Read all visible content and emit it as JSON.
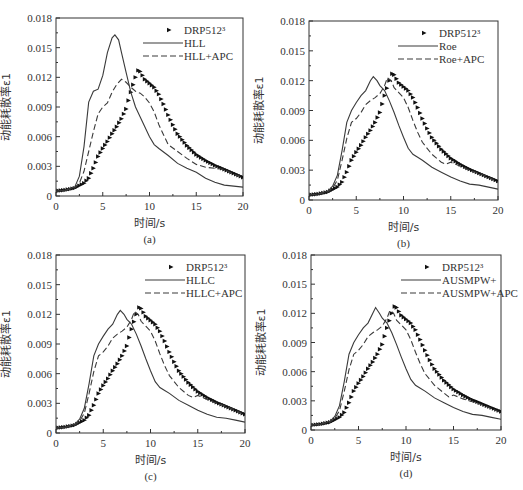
{
  "chart_data": [
    {
      "panel": "a",
      "type": "line",
      "caption": "(a)",
      "xlabel": "时间/s",
      "ylabel": "动能耗散率ε1",
      "xlim": [
        0,
        20
      ],
      "ylim": [
        0,
        0.018
      ],
      "xticks": [
        0,
        5,
        10,
        15,
        20
      ],
      "yticks": [
        0,
        0.003,
        0.006,
        0.009,
        0.012,
        0.015,
        0.018
      ],
      "ytick_labels": [
        "0",
        "0.003",
        "0.006",
        "0.009",
        "0.012",
        "0.015",
        "0.018"
      ],
      "legend_position": "upper right",
      "frame": {
        "x0": 56,
        "y0": 18,
        "x1": 243,
        "y1": 196
      },
      "series": [
        {
          "name": "DRP512³",
          "style": "markers",
          "x": [
            0,
            1,
            2,
            3,
            3.5,
            4,
            4.5,
            5,
            5.5,
            6,
            6.5,
            7,
            7.5,
            8,
            8.5,
            8.8,
            9,
            9.5,
            10,
            10.5,
            11,
            11.5,
            12,
            12.5,
            13,
            13.5,
            14,
            15,
            16,
            17,
            18,
            19,
            20
          ],
          "y": [
            0.0005,
            0.0006,
            0.0008,
            0.0013,
            0.0018,
            0.0028,
            0.004,
            0.0048,
            0.0055,
            0.0063,
            0.007,
            0.0078,
            0.0088,
            0.0105,
            0.012,
            0.0127,
            0.0126,
            0.0118,
            0.0114,
            0.011,
            0.0103,
            0.0093,
            0.0082,
            0.0072,
            0.0063,
            0.0057,
            0.0051,
            0.0042,
            0.0036,
            0.0031,
            0.0027,
            0.0023,
            0.0019
          ]
        },
        {
          "name": "HLL",
          "style": "solid",
          "x": [
            0,
            1,
            2,
            2.5,
            3,
            3.5,
            4,
            4.5,
            5,
            5.5,
            6,
            6.3,
            6.7,
            7,
            7.5,
            8,
            8.5,
            9,
            9.5,
            10,
            10.5,
            11,
            12,
            13,
            14,
            15,
            16,
            17,
            18,
            19,
            20
          ],
          "y": [
            0.0005,
            0.0006,
            0.0009,
            0.002,
            0.005,
            0.0095,
            0.0106,
            0.0108,
            0.0122,
            0.0145,
            0.016,
            0.0163,
            0.0158,
            0.0145,
            0.0125,
            0.0105,
            0.009,
            0.008,
            0.007,
            0.006,
            0.0052,
            0.0048,
            0.0041,
            0.0033,
            0.0028,
            0.0024,
            0.0018,
            0.0014,
            0.0011,
            0.001,
            0.0009
          ]
        },
        {
          "name": "HLL+APC",
          "style": "dashed",
          "x": [
            0,
            1,
            2,
            2.5,
            3,
            3.5,
            4,
            4.5,
            5,
            5.5,
            6,
            6.5,
            7,
            7.5,
            8,
            8.5,
            9,
            9.5,
            10,
            10.5,
            11,
            11.5,
            12,
            13,
            14,
            15,
            16,
            17,
            18,
            19,
            20
          ],
          "y": [
            0.0005,
            0.0006,
            0.0008,
            0.0013,
            0.0025,
            0.0045,
            0.0065,
            0.0083,
            0.009,
            0.0094,
            0.0105,
            0.0113,
            0.0118,
            0.0115,
            0.011,
            0.0106,
            0.0104,
            0.01,
            0.0094,
            0.0085,
            0.0072,
            0.0062,
            0.0052,
            0.0045,
            0.0038,
            0.0032,
            0.0029,
            0.0028,
            0.0027,
            0.0022,
            0.0019
          ]
        }
      ]
    },
    {
      "panel": "b",
      "type": "line",
      "caption": "(b)",
      "xlabel": "时间/s",
      "ylabel": "动能耗散率ε1",
      "xlim": [
        0,
        20
      ],
      "ylim": [
        0,
        0.018
      ],
      "xticks": [
        0,
        5,
        10,
        15,
        20
      ],
      "yticks": [
        0,
        0.003,
        0.006,
        0.009,
        0.012,
        0.015,
        0.018
      ],
      "ytick_labels": [
        "0",
        "0.003",
        "0.006",
        "0.009",
        "0.012",
        "0.015",
        "0.018"
      ],
      "legend_position": "upper right",
      "frame": {
        "x0": 309,
        "y0": 21,
        "x1": 498,
        "y1": 200
      },
      "series": [
        {
          "name": "DRP512³",
          "style": "markers",
          "x": [
            0,
            1,
            2,
            3,
            3.5,
            4,
            4.5,
            5,
            5.5,
            6,
            6.5,
            7,
            7.5,
            8,
            8.5,
            8.8,
            9,
            9.5,
            10,
            10.5,
            11,
            11.5,
            12,
            12.5,
            13,
            13.5,
            14,
            15,
            16,
            17,
            18,
            19,
            20
          ],
          "y": [
            0.0005,
            0.0006,
            0.0008,
            0.0013,
            0.0018,
            0.0028,
            0.004,
            0.0048,
            0.0055,
            0.0063,
            0.007,
            0.0078,
            0.0088,
            0.0105,
            0.012,
            0.0127,
            0.0126,
            0.0118,
            0.0114,
            0.011,
            0.0103,
            0.0093,
            0.0082,
            0.0072,
            0.0063,
            0.0057,
            0.0051,
            0.0042,
            0.0036,
            0.0031,
            0.0027,
            0.0023,
            0.0019
          ]
        },
        {
          "name": "Roe",
          "style": "solid",
          "x": [
            0,
            1,
            2,
            2.5,
            3,
            3.5,
            4,
            4.5,
            5,
            5.5,
            6,
            6.5,
            6.8,
            7.2,
            7.5,
            8,
            8.5,
            9,
            9.5,
            10,
            10.5,
            11,
            11.5,
            12,
            13,
            14,
            15,
            16,
            17,
            18,
            19,
            20
          ],
          "y": [
            0.0005,
            0.0006,
            0.0009,
            0.0014,
            0.0025,
            0.005,
            0.0078,
            0.009,
            0.0098,
            0.0105,
            0.011,
            0.012,
            0.0124,
            0.012,
            0.0115,
            0.011,
            0.01,
            0.0088,
            0.0075,
            0.0063,
            0.0052,
            0.0046,
            0.0043,
            0.004,
            0.0033,
            0.0028,
            0.0023,
            0.0019,
            0.0016,
            0.0015,
            0.0013,
            0.0011
          ]
        },
        {
          "name": "Roe+APC",
          "style": "dashed",
          "x": [
            0,
            1,
            2,
            2.5,
            3,
            3.5,
            4,
            4.5,
            5,
            5.5,
            6,
            6.5,
            7,
            7.5,
            8,
            8.3,
            8.7,
            9,
            9.5,
            10,
            10.5,
            11,
            11.5,
            12,
            13,
            14,
            14.5,
            15,
            16,
            17,
            18,
            19,
            20
          ],
          "y": [
            0.0005,
            0.0006,
            0.0008,
            0.0012,
            0.002,
            0.004,
            0.0062,
            0.0078,
            0.0082,
            0.0088,
            0.0096,
            0.01,
            0.0103,
            0.0107,
            0.0115,
            0.0123,
            0.012,
            0.0113,
            0.0108,
            0.0103,
            0.0093,
            0.008,
            0.0068,
            0.0058,
            0.0046,
            0.0038,
            0.0036,
            0.0038,
            0.0034,
            0.003,
            0.0027,
            0.0023,
            0.0018
          ]
        }
      ]
    },
    {
      "panel": "c",
      "type": "line",
      "caption": "(c)",
      "xlabel": "时间/s",
      "ylabel": "动能耗散率ε1",
      "xlim": [
        0,
        20
      ],
      "ylim": [
        0,
        0.018
      ],
      "xticks": [
        0,
        5,
        10,
        15,
        20
      ],
      "yticks": [
        0,
        0.003,
        0.006,
        0.009,
        0.012,
        0.015,
        0.018
      ],
      "ytick_labels": [
        "0",
        "0.003",
        "0.006",
        "0.009",
        "0.012",
        "0.015",
        "0.018"
      ],
      "legend_position": "upper right",
      "frame": {
        "x0": 56,
        "y0": 255,
        "x1": 245,
        "y1": 433
      },
      "series": [
        {
          "name": "DRP512³",
          "style": "markers",
          "x": [
            0,
            1,
            2,
            3,
            3.5,
            4,
            4.5,
            5,
            5.5,
            6,
            6.5,
            7,
            7.5,
            8,
            8.5,
            8.8,
            9,
            9.5,
            10,
            10.5,
            11,
            11.5,
            12,
            12.5,
            13,
            13.5,
            14,
            15,
            16,
            17,
            18,
            19,
            20
          ],
          "y": [
            0.0005,
            0.0006,
            0.0008,
            0.0013,
            0.0018,
            0.0028,
            0.004,
            0.0048,
            0.0055,
            0.0063,
            0.007,
            0.0078,
            0.0088,
            0.0105,
            0.012,
            0.0127,
            0.0126,
            0.0118,
            0.0114,
            0.011,
            0.0103,
            0.0093,
            0.0082,
            0.0072,
            0.0063,
            0.0057,
            0.0051,
            0.0042,
            0.0036,
            0.0031,
            0.0027,
            0.0023,
            0.0019
          ]
        },
        {
          "name": "HLLC",
          "style": "solid",
          "x": [
            0,
            1,
            2,
            2.5,
            3,
            3.5,
            4,
            4.5,
            5,
            5.5,
            6,
            6.5,
            6.8,
            7.2,
            7.5,
            8,
            8.5,
            9,
            9.5,
            10,
            10.5,
            11,
            11.5,
            12,
            13,
            14,
            15,
            16,
            17,
            18,
            19,
            20
          ],
          "y": [
            0.0005,
            0.0006,
            0.0009,
            0.0014,
            0.0025,
            0.005,
            0.0078,
            0.009,
            0.0098,
            0.0105,
            0.011,
            0.012,
            0.0124,
            0.012,
            0.0115,
            0.011,
            0.01,
            0.0088,
            0.0075,
            0.0063,
            0.0052,
            0.0046,
            0.0043,
            0.004,
            0.0033,
            0.0028,
            0.0023,
            0.0019,
            0.0016,
            0.0015,
            0.0013,
            0.0011
          ]
        },
        {
          "name": "HLLC+APC",
          "style": "dashed",
          "x": [
            0,
            1,
            2,
            2.5,
            3,
            3.5,
            4,
            4.5,
            5,
            5.5,
            6,
            6.5,
            7,
            7.5,
            8,
            8.3,
            8.7,
            9,
            9.5,
            10,
            10.5,
            11,
            11.5,
            12,
            13,
            14,
            14.5,
            15,
            16,
            17,
            18,
            19,
            20
          ],
          "y": [
            0.0005,
            0.0006,
            0.0008,
            0.0012,
            0.002,
            0.004,
            0.0062,
            0.0078,
            0.0082,
            0.0088,
            0.0096,
            0.01,
            0.0103,
            0.0107,
            0.0115,
            0.0123,
            0.012,
            0.0113,
            0.0108,
            0.0103,
            0.0093,
            0.008,
            0.0068,
            0.0058,
            0.0046,
            0.0038,
            0.0036,
            0.0038,
            0.0034,
            0.003,
            0.0027,
            0.0023,
            0.0018
          ]
        }
      ]
    },
    {
      "panel": "d",
      "type": "line",
      "caption": "(d)",
      "xlabel": "时间/s",
      "ylabel": "动能耗散率ε1",
      "xlim": [
        0,
        20
      ],
      "ylim": [
        0,
        0.018
      ],
      "xticks": [
        0,
        5,
        10,
        15,
        20
      ],
      "yticks": [
        0,
        0.003,
        0.006,
        0.009,
        0.012,
        0.015,
        0.018
      ],
      "ytick_labels": [
        "0",
        "0.003",
        "0.006",
        "0.009",
        "0.012",
        "0.015",
        "0.018"
      ],
      "legend_position": "upper right",
      "frame": {
        "x0": 311,
        "y0": 255,
        "x1": 501,
        "y1": 430
      },
      "series": [
        {
          "name": "DRP512³",
          "style": "markers",
          "x": [
            0,
            1,
            2,
            3,
            3.5,
            4,
            4.5,
            5,
            5.5,
            6,
            6.5,
            7,
            7.5,
            8,
            8.5,
            8.8,
            9,
            9.5,
            10,
            10.5,
            11,
            11.5,
            12,
            12.5,
            13,
            13.5,
            14,
            15,
            16,
            17,
            18,
            19,
            20
          ],
          "y": [
            0.0005,
            0.0006,
            0.0008,
            0.0013,
            0.0018,
            0.0028,
            0.004,
            0.0048,
            0.0055,
            0.0063,
            0.007,
            0.0078,
            0.0088,
            0.0105,
            0.012,
            0.0127,
            0.0126,
            0.0118,
            0.0114,
            0.011,
            0.0103,
            0.0093,
            0.0082,
            0.0072,
            0.0063,
            0.0057,
            0.0051,
            0.0042,
            0.0036,
            0.0031,
            0.0027,
            0.0023,
            0.0019
          ]
        },
        {
          "name": "AUSMPW+",
          "style": "solid",
          "x": [
            0,
            1,
            2,
            2.5,
            3,
            3.5,
            4,
            4.5,
            5,
            5.5,
            6,
            6.5,
            6.8,
            7.2,
            7.5,
            8,
            8.5,
            9,
            9.5,
            10,
            10.5,
            11,
            11.5,
            12,
            13,
            14,
            15,
            16,
            17,
            18,
            19,
            20
          ],
          "y": [
            0.0005,
            0.0006,
            0.0009,
            0.0014,
            0.0025,
            0.005,
            0.0078,
            0.009,
            0.0098,
            0.0105,
            0.011,
            0.012,
            0.0126,
            0.012,
            0.0115,
            0.011,
            0.01,
            0.0088,
            0.0075,
            0.0063,
            0.0052,
            0.0046,
            0.0043,
            0.004,
            0.0033,
            0.0028,
            0.0023,
            0.0019,
            0.0016,
            0.0015,
            0.0013,
            0.0011
          ]
        },
        {
          "name": "AUSMPW+APC",
          "style": "dashed",
          "x": [
            0,
            1,
            2,
            2.5,
            3,
            3.5,
            4,
            4.5,
            5,
            5.5,
            6,
            6.5,
            7,
            7.5,
            8,
            8.3,
            8.7,
            9,
            9.5,
            10,
            10.5,
            11,
            11.5,
            12,
            13,
            14,
            14.5,
            15,
            16,
            17,
            18,
            19,
            20
          ],
          "y": [
            0.0005,
            0.0006,
            0.0008,
            0.0012,
            0.002,
            0.004,
            0.0062,
            0.0078,
            0.0082,
            0.0088,
            0.0096,
            0.01,
            0.0103,
            0.0107,
            0.0115,
            0.0123,
            0.012,
            0.0113,
            0.0108,
            0.0103,
            0.0093,
            0.008,
            0.0068,
            0.0058,
            0.0046,
            0.0038,
            0.0034,
            0.0036,
            0.0032,
            0.0029,
            0.0026,
            0.0022,
            0.0018
          ]
        }
      ]
    }
  ],
  "style": {
    "line_color": "#3a3a3a",
    "marker_color": "#111111",
    "axis_color": "#333333"
  }
}
